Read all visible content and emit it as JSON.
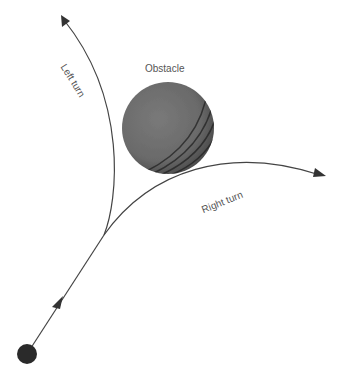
{
  "diagram": {
    "labels": {
      "obstacle": "Obstacle",
      "left_turn": "Left turn",
      "right_turn": "Right turn"
    },
    "colors": {
      "line": "#444444",
      "obstacle": "#6e6e6e",
      "start_dot": "#2a2a2a",
      "text": "#555555"
    },
    "nodes": [
      {
        "id": "start",
        "shape": "filled-circle"
      },
      {
        "id": "obstacle",
        "shape": "shaded-sphere"
      }
    ],
    "paths": [
      {
        "id": "approach",
        "from": "start",
        "to": "branch-point"
      },
      {
        "id": "left-turn",
        "from": "branch-point",
        "direction": "up-left"
      },
      {
        "id": "right-turn",
        "from": "branch-point",
        "direction": "right"
      }
    ]
  }
}
